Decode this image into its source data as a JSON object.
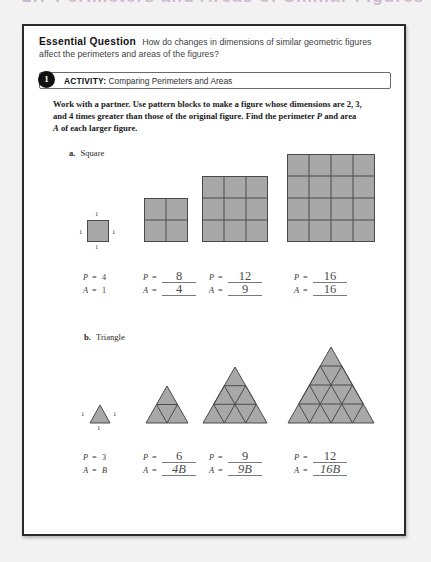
{
  "chapter_header": "2.7 Perimeters and Areas of Similar Figures",
  "essential_question": {
    "label": "Essential Question",
    "text": "How do changes in dimensions of similar geometric figures affect the perimeters and areas of the figures?"
  },
  "activity": {
    "number": "1",
    "label": "ACTIVITY:",
    "title": "Comparing Perimeters and Areas"
  },
  "instructions": {
    "line1": "Work with a partner. Use pattern blocks to make a figure whose dimensions",
    "line2": "are 2, 3, and 4 times greater than those of the original figure. Find the",
    "line3_pre": "perimeter ",
    "line3_p": "P",
    "line3_mid": " and area ",
    "line3_a": "A",
    "line3_post": " of each larger figure."
  },
  "sections": [
    {
      "letter": "a.",
      "name": "Square",
      "unit_labels": {
        "top": "1",
        "left": "1",
        "right": "1",
        "bottom": "1"
      },
      "figures": [
        {
          "scale": 1,
          "grid": 2,
          "divisions": 1,
          "unit_count": 1
        },
        {
          "scale": 2,
          "grid": 2,
          "divisions": 2,
          "unit_count": 4
        },
        {
          "scale": 3,
          "grid": 3,
          "divisions": 3,
          "unit_count": 9
        },
        {
          "scale": 4,
          "grid": 4,
          "divisions": 4,
          "unit_count": 16
        }
      ],
      "answers": [
        {
          "p_symbol": "P",
          "a_symbol": "A",
          "eq": "=",
          "p_value": "4",
          "a_value": "1",
          "filled": false
        },
        {
          "p_symbol": "P",
          "a_symbol": "A",
          "eq": "=",
          "p_value": "8",
          "a_value": "4",
          "filled": true
        },
        {
          "p_symbol": "P",
          "a_symbol": "A",
          "eq": "=",
          "p_value": "12",
          "a_value": "9",
          "filled": true
        },
        {
          "p_symbol": "P",
          "a_symbol": "A",
          "eq": "=",
          "p_value": "16",
          "a_value": "16",
          "filled": true
        }
      ]
    },
    {
      "letter": "b.",
      "name": "Triangle",
      "unit_labels": {
        "left": "1",
        "right": "1",
        "bottom": "1"
      },
      "figures": [
        {
          "scale": 1,
          "divisions": 1,
          "unit_count": 1
        },
        {
          "scale": 2,
          "divisions": 2,
          "unit_count": 4
        },
        {
          "scale": 3,
          "divisions": 3,
          "unit_count": 9
        },
        {
          "scale": 4,
          "divisions": 4,
          "unit_count": 16
        }
      ],
      "answers": [
        {
          "p_symbol": "P",
          "a_symbol": "A",
          "eq": "=",
          "p_value": "3",
          "a_value": "B",
          "filled": false
        },
        {
          "p_symbol": "P",
          "a_symbol": "A",
          "eq": "=",
          "p_value": "6",
          "a_value": "4B",
          "filled": true
        },
        {
          "p_symbol": "P",
          "a_symbol": "A",
          "eq": "=",
          "p_value": "9",
          "a_value": "9B",
          "filled": true
        },
        {
          "p_symbol": "P",
          "a_symbol": "A",
          "eq": "=",
          "p_value": "12",
          "a_value": "16B",
          "filled": true
        }
      ]
    }
  ],
  "colors": {
    "shape_fill": "#a8a8a8",
    "shape_stroke": "#4a4a4a",
    "page_border": "#2b2b2b",
    "header_accent": "#b08fb0"
  }
}
